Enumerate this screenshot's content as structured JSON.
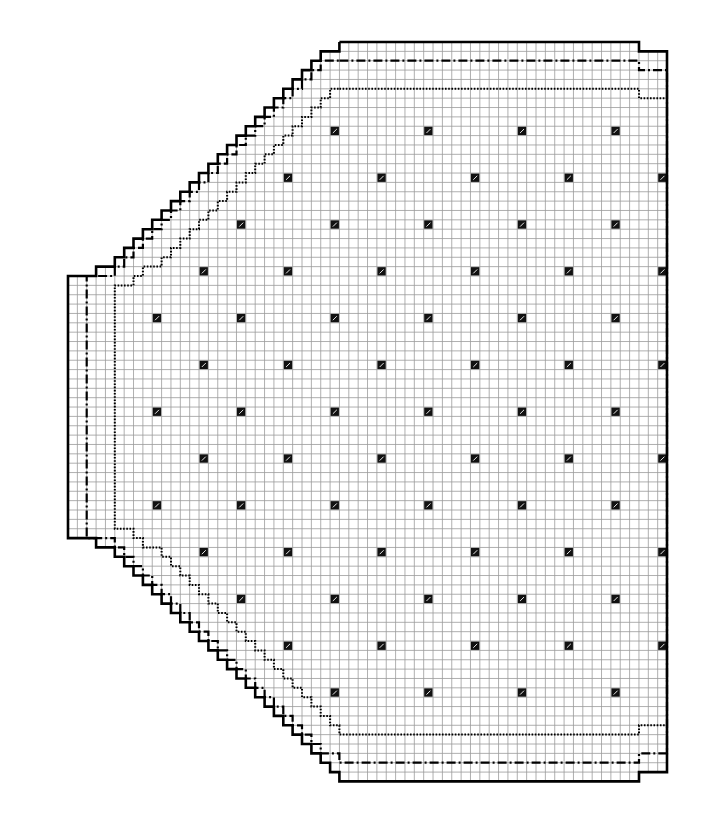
{
  "colors": {
    "background": "#ffffff",
    "grid_line": "#9a9a9a",
    "outline": "#000000",
    "marker_fill": "#111111",
    "marker_slash": "#ffffff"
  },
  "grid": {
    "origin_x": 68,
    "origin_y": 42,
    "cell": 9.36,
    "cols": 64,
    "rows": 79
  },
  "legend_lines": [
    {
      "name": "outer-size-outline",
      "style": "solid"
    },
    {
      "name": "middle-size-outline",
      "style": "dash-dot"
    },
    {
      "name": "inner-size-outline",
      "style": "dotted"
    }
  ],
  "outlines": {
    "solid": [
      [
        29,
        0
      ],
      [
        61,
        0
      ],
      [
        61,
        1
      ],
      [
        64,
        1
      ],
      [
        64,
        6
      ],
      [
        64,
        78
      ],
      [
        64,
        78
      ],
      [
        61,
        78
      ],
      [
        61,
        79
      ],
      [
        29,
        79
      ],
      [
        29,
        78
      ],
      [
        28,
        78
      ],
      [
        28,
        77
      ],
      [
        27,
        77
      ],
      [
        27,
        76
      ],
      [
        26,
        76
      ],
      [
        26,
        75
      ],
      [
        25,
        75
      ],
      [
        25,
        74
      ],
      [
        24,
        74
      ],
      [
        24,
        73
      ],
      [
        23,
        73
      ],
      [
        23,
        72
      ],
      [
        22,
        72
      ],
      [
        22,
        71
      ],
      [
        21,
        71
      ],
      [
        21,
        70
      ],
      [
        20,
        70
      ],
      [
        20,
        69
      ],
      [
        19,
        69
      ],
      [
        19,
        68
      ],
      [
        18,
        68
      ],
      [
        18,
        67
      ],
      [
        17,
        67
      ],
      [
        17,
        66
      ],
      [
        16,
        66
      ],
      [
        16,
        65
      ],
      [
        15,
        65
      ],
      [
        15,
        64
      ],
      [
        14,
        64
      ],
      [
        14,
        63
      ],
      [
        13,
        63
      ],
      [
        13,
        62
      ],
      [
        12,
        62
      ],
      [
        12,
        61
      ],
      [
        11,
        61
      ],
      [
        11,
        60
      ],
      [
        10,
        60
      ],
      [
        10,
        59
      ],
      [
        9,
        59
      ],
      [
        9,
        58
      ],
      [
        8,
        58
      ],
      [
        8,
        57
      ],
      [
        7,
        57
      ],
      [
        7,
        56
      ],
      [
        6,
        56
      ],
      [
        6,
        55
      ],
      [
        5,
        55
      ],
      [
        5,
        54
      ],
      [
        3,
        54
      ],
      [
        3,
        53
      ],
      [
        0,
        53
      ],
      [
        0,
        25
      ],
      [
        3,
        25
      ],
      [
        3,
        24
      ],
      [
        5,
        24
      ],
      [
        5,
        23
      ],
      [
        6,
        23
      ],
      [
        6,
        22
      ],
      [
        7,
        22
      ],
      [
        7,
        21
      ],
      [
        8,
        21
      ],
      [
        8,
        20
      ],
      [
        9,
        20
      ],
      [
        9,
        19
      ],
      [
        10,
        19
      ],
      [
        10,
        18
      ],
      [
        11,
        18
      ],
      [
        11,
        17
      ],
      [
        12,
        17
      ],
      [
        12,
        16
      ],
      [
        13,
        16
      ],
      [
        13,
        15
      ],
      [
        14,
        15
      ],
      [
        14,
        14
      ],
      [
        15,
        14
      ],
      [
        15,
        13
      ],
      [
        16,
        13
      ],
      [
        16,
        12
      ],
      [
        17,
        12
      ],
      [
        17,
        11
      ],
      [
        18,
        11
      ],
      [
        18,
        10
      ],
      [
        19,
        10
      ],
      [
        19,
        9
      ],
      [
        20,
        9
      ],
      [
        20,
        8
      ],
      [
        21,
        8
      ],
      [
        21,
        7
      ],
      [
        22,
        7
      ],
      [
        22,
        6
      ],
      [
        23,
        6
      ],
      [
        23,
        5
      ],
      [
        24,
        5
      ],
      [
        24,
        4
      ],
      [
        25,
        4
      ],
      [
        25,
        3
      ],
      [
        26,
        3
      ],
      [
        26,
        2
      ],
      [
        27,
        2
      ],
      [
        27,
        1
      ],
      [
        29,
        1
      ],
      [
        29,
        0
      ]
    ],
    "dashdot": [
      [
        29,
        2
      ],
      [
        61,
        2
      ],
      [
        61,
        3
      ],
      [
        64,
        3
      ],
      [
        64,
        76
      ],
      [
        61,
        76
      ],
      [
        61,
        77
      ],
      [
        29,
        77
      ],
      [
        29,
        76
      ],
      [
        27,
        76
      ],
      [
        27,
        75
      ],
      [
        26,
        75
      ],
      [
        26,
        74
      ],
      [
        25,
        74
      ],
      [
        25,
        73
      ],
      [
        24,
        73
      ],
      [
        24,
        72
      ],
      [
        23,
        72
      ],
      [
        23,
        71
      ],
      [
        22,
        71
      ],
      [
        22,
        70
      ],
      [
        21,
        70
      ],
      [
        21,
        69
      ],
      [
        20,
        69
      ],
      [
        20,
        68
      ],
      [
        19,
        68
      ],
      [
        19,
        67
      ],
      [
        18,
        67
      ],
      [
        18,
        66
      ],
      [
        17,
        66
      ],
      [
        17,
        65
      ],
      [
        16,
        65
      ],
      [
        16,
        64
      ],
      [
        15,
        64
      ],
      [
        15,
        63
      ],
      [
        14,
        63
      ],
      [
        14,
        62
      ],
      [
        13,
        62
      ],
      [
        13,
        61
      ],
      [
        12,
        61
      ],
      [
        12,
        60
      ],
      [
        11,
        60
      ],
      [
        11,
        59
      ],
      [
        10,
        59
      ],
      [
        10,
        58
      ],
      [
        9,
        58
      ],
      [
        9,
        57
      ],
      [
        8,
        57
      ],
      [
        8,
        56
      ],
      [
        7,
        56
      ],
      [
        7,
        55
      ],
      [
        6,
        55
      ],
      [
        6,
        54
      ],
      [
        5,
        54
      ],
      [
        5,
        53
      ],
      [
        2,
        53
      ],
      [
        2,
        25
      ],
      [
        5,
        25
      ],
      [
        5,
        24
      ],
      [
        6,
        24
      ],
      [
        6,
        23
      ],
      [
        7,
        23
      ],
      [
        7,
        22
      ],
      [
        8,
        22
      ],
      [
        8,
        21
      ],
      [
        9,
        21
      ],
      [
        9,
        20
      ],
      [
        10,
        20
      ],
      [
        10,
        19
      ],
      [
        11,
        19
      ],
      [
        11,
        18
      ],
      [
        12,
        18
      ],
      [
        12,
        17
      ],
      [
        13,
        17
      ],
      [
        13,
        16
      ],
      [
        14,
        16
      ],
      [
        14,
        15
      ],
      [
        15,
        15
      ],
      [
        15,
        14
      ],
      [
        16,
        14
      ],
      [
        16,
        13
      ],
      [
        17,
        13
      ],
      [
        17,
        12
      ],
      [
        18,
        12
      ],
      [
        18,
        11
      ],
      [
        19,
        11
      ],
      [
        19,
        10
      ],
      [
        20,
        10
      ],
      [
        20,
        9
      ],
      [
        21,
        9
      ],
      [
        21,
        8
      ],
      [
        22,
        8
      ],
      [
        22,
        7
      ],
      [
        23,
        7
      ],
      [
        23,
        6
      ],
      [
        24,
        6
      ],
      [
        24,
        5
      ],
      [
        25,
        5
      ],
      [
        25,
        4
      ],
      [
        26,
        4
      ],
      [
        26,
        3
      ],
      [
        27,
        3
      ],
      [
        27,
        2
      ],
      [
        29,
        2
      ]
    ],
    "dotted": [
      [
        29,
        5
      ],
      [
        61,
        5
      ],
      [
        61,
        6
      ],
      [
        64,
        6
      ],
      [
        64,
        73
      ],
      [
        61,
        73
      ],
      [
        61,
        74
      ],
      [
        29,
        74
      ],
      [
        29,
        73
      ],
      [
        28,
        73
      ],
      [
        28,
        72
      ],
      [
        27,
        72
      ],
      [
        27,
        71
      ],
      [
        26,
        71
      ],
      [
        26,
        70
      ],
      [
        25,
        70
      ],
      [
        25,
        69
      ],
      [
        24,
        69
      ],
      [
        24,
        68
      ],
      [
        23,
        68
      ],
      [
        23,
        67
      ],
      [
        22,
        67
      ],
      [
        22,
        66
      ],
      [
        21,
        66
      ],
      [
        21,
        65
      ],
      [
        20,
        65
      ],
      [
        20,
        64
      ],
      [
        19,
        64
      ],
      [
        19,
        63
      ],
      [
        18,
        63
      ],
      [
        18,
        62
      ],
      [
        17,
        62
      ],
      [
        17,
        61
      ],
      [
        16,
        61
      ],
      [
        16,
        60
      ],
      [
        15,
        60
      ],
      [
        15,
        59
      ],
      [
        14,
        59
      ],
      [
        14,
        58
      ],
      [
        13,
        58
      ],
      [
        13,
        57
      ],
      [
        12,
        57
      ],
      [
        12,
        56
      ],
      [
        11,
        56
      ],
      [
        11,
        55
      ],
      [
        10,
        55
      ],
      [
        10,
        54
      ],
      [
        8,
        54
      ],
      [
        8,
        53
      ],
      [
        7,
        53
      ],
      [
        7,
        52
      ],
      [
        5,
        52
      ],
      [
        5,
        26
      ],
      [
        7,
        26
      ],
      [
        7,
        25
      ],
      [
        8,
        25
      ],
      [
        8,
        24
      ],
      [
        10,
        24
      ],
      [
        10,
        23
      ],
      [
        11,
        23
      ],
      [
        11,
        22
      ],
      [
        12,
        22
      ],
      [
        12,
        21
      ],
      [
        13,
        21
      ],
      [
        13,
        20
      ],
      [
        14,
        20
      ],
      [
        14,
        19
      ],
      [
        15,
        19
      ],
      [
        15,
        18
      ],
      [
        16,
        18
      ],
      [
        16,
        17
      ],
      [
        17,
        17
      ],
      [
        17,
        16
      ],
      [
        18,
        16
      ],
      [
        18,
        15
      ],
      [
        19,
        15
      ],
      [
        19,
        14
      ],
      [
        20,
        14
      ],
      [
        20,
        13
      ],
      [
        21,
        13
      ],
      [
        21,
        12
      ],
      [
        22,
        12
      ],
      [
        22,
        11
      ],
      [
        23,
        11
      ],
      [
        23,
        10
      ],
      [
        24,
        10
      ],
      [
        24,
        9
      ],
      [
        25,
        9
      ],
      [
        25,
        8
      ],
      [
        26,
        8
      ],
      [
        26,
        7
      ],
      [
        27,
        7
      ],
      [
        27,
        6
      ],
      [
        28,
        6
      ],
      [
        28,
        5
      ],
      [
        29,
        5
      ]
    ]
  },
  "markers": {
    "rows": [
      {
        "row": 9,
        "cols": [
          28,
          38,
          48,
          58
        ]
      },
      {
        "row": 14,
        "cols": [
          23,
          33,
          43,
          53,
          63
        ]
      },
      {
        "row": 19,
        "cols": [
          18,
          28,
          38,
          48,
          58
        ]
      },
      {
        "row": 24,
        "cols": [
          14,
          23,
          33,
          43,
          53,
          63
        ]
      },
      {
        "row": 29,
        "cols": [
          9,
          18,
          28,
          38,
          48,
          58
        ]
      },
      {
        "row": 34,
        "cols": [
          14,
          23,
          33,
          43,
          53,
          63
        ]
      },
      {
        "row": 39,
        "cols": [
          9,
          18,
          28,
          38,
          48,
          58
        ]
      },
      {
        "row": 44,
        "cols": [
          14,
          23,
          33,
          43,
          53,
          63
        ]
      },
      {
        "row": 49,
        "cols": [
          9,
          18,
          28,
          38,
          48,
          58
        ]
      },
      {
        "row": 54,
        "cols": [
          14,
          23,
          33,
          43,
          53,
          63
        ]
      },
      {
        "row": 59,
        "cols": [
          18,
          28,
          38,
          48,
          58
        ]
      },
      {
        "row": 64,
        "cols": [
          23,
          33,
          43,
          53,
          63
        ]
      },
      {
        "row": 69,
        "cols": [
          28,
          38,
          48,
          58
        ]
      }
    ]
  }
}
